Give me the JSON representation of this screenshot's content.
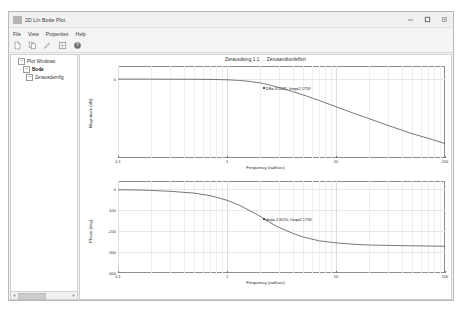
{
  "window": {
    "title": "2D Lin Bode Plot",
    "icon": "app-icon",
    "controls": {
      "minimize": "–",
      "maximize": "□",
      "close": "✕"
    }
  },
  "menu": {
    "items": [
      "File",
      "View",
      "Properties",
      "Help"
    ]
  },
  "toolbar": {
    "items": [
      {
        "name": "new-icon",
        "glyph": "new"
      },
      {
        "name": "copy-icon",
        "glyph": "copy"
      },
      {
        "name": "edit-icon",
        "glyph": "edit"
      },
      {
        "name": "grid-icon",
        "glyph": "grid"
      },
      {
        "name": "help-icon",
        "glyph": "help"
      }
    ]
  },
  "tree": {
    "nodes": [
      {
        "label": "Plot Windows",
        "level": 1,
        "expanded": false,
        "selected": false,
        "twist": ""
      },
      {
        "label": "Bode",
        "level": 2,
        "expanded": true,
        "selected": true,
        "twist": "−"
      },
      {
        "label": "Zerausdemfig",
        "level": 3,
        "expanded": false,
        "selected": false,
        "twist": ""
      }
    ]
  },
  "scrollbar": {
    "left_arrow": "◀",
    "right_arrow": "▶"
  },
  "chart_data": [
    {
      "type": "line",
      "id": "magnitude",
      "title": "Zerausdsing 1:1 → Zerusandtonfeffort",
      "xlabel": "Frequency (rad/sec)",
      "ylabel": "Magnitude (dB)",
      "xscale": "log",
      "xlim": [
        0.1,
        100
      ],
      "ylim": [
        -60,
        10
      ],
      "xticks": [
        0.1,
        1,
        10,
        100
      ],
      "xticklabels": [
        "0.1",
        "1",
        "10",
        "100"
      ],
      "yticks": [
        0
      ],
      "yticklabels": [
        "0"
      ],
      "grid": true,
      "series": [
        {
          "name": "Bode magnitude",
          "x": [
            0.1,
            0.15,
            0.2,
            0.3,
            0.5,
            0.7,
            1.0,
            1.3,
            1.6,
            2.0,
            2.1759,
            2.5,
            3.0,
            4.0,
            5.0,
            7.0,
            10.0,
            15.0,
            20.0,
            30.0,
            50.0,
            70.0,
            100.0
          ],
          "y": [
            0.0,
            0.0,
            0.0,
            -0.05,
            -0.1,
            -0.2,
            -0.5,
            -1.0,
            -1.7,
            -2.8,
            -3.4,
            -4.6,
            -6.4,
            -9.4,
            -12.0,
            -16.2,
            -21.0,
            -26.4,
            -30.0,
            -35.2,
            -41.5,
            -45.0,
            -49.0
          ]
        }
      ],
      "datatip": {
        "text": "DB=-6.0235, freq=2.1759",
        "x": 2.1759,
        "y": -6.0235
      }
    },
    {
      "type": "line",
      "id": "phase",
      "title": "",
      "xlabel": "Frequency (rad/sec)",
      "ylabel": "Phase (deg)",
      "xscale": "log",
      "xlim": [
        0.1,
        100
      ],
      "ylim": [
        -400,
        40
      ],
      "xticks": [
        0.1,
        1,
        10,
        100
      ],
      "xticklabels": [
        "0.1",
        "1",
        "10",
        "100"
      ],
      "yticks": [
        0,
        -100,
        -200,
        -300,
        -400
      ],
      "yticklabels": [
        "0",
        "-100",
        "-200",
        "-300",
        "-400"
      ],
      "grid": true,
      "series": [
        {
          "name": "Bode phase",
          "x": [
            0.1,
            0.15,
            0.2,
            0.3,
            0.5,
            0.7,
            1.0,
            1.3,
            1.6,
            2.0,
            2.1759,
            2.5,
            3.0,
            4.0,
            5.0,
            7.0,
            10.0,
            15.0,
            20.0,
            30.0,
            50.0,
            70.0,
            100.0
          ],
          "y": [
            -2.0,
            -3.0,
            -5.0,
            -9.0,
            -18.0,
            -30.0,
            -52.0,
            -76.0,
            -100.0,
            -128.0,
            -140.0,
            -160.0,
            -182.0,
            -210.0,
            -228.0,
            -246.0,
            -256.0,
            -263.0,
            -266.0,
            -268.0,
            -270.0,
            -271.0,
            -272.0
          ]
        }
      ],
      "datatip": {
        "text": "deg=-2.8220, freq=2.1759",
        "x": 2.1759,
        "y": -140.0
      }
    }
  ],
  "colors": {
    "curve": "#555555",
    "frame": "#8d8d8d",
    "grid": "#e8e8e8",
    "text": "#2a2a2a"
  }
}
